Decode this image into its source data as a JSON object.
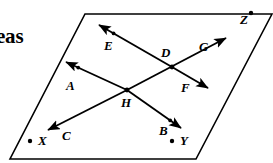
{
  "figure": {
    "margin_text": "eas",
    "plane": {
      "name": "plane-parallelogram",
      "corners": [
        [
          85,
          14
        ],
        [
          272,
          14
        ],
        [
          196,
          159
        ],
        [
          10,
          159
        ]
      ]
    },
    "named_points": [
      {
        "label": "X",
        "dot_side": "left",
        "x": 38,
        "y": 145
      },
      {
        "label": "Y",
        "dot_side": "left",
        "x": 180,
        "y": 145
      },
      {
        "label": "Z",
        "dot_side": "right",
        "x": 240,
        "y": 24
      }
    ],
    "intersection_points": [
      {
        "label": "D",
        "x": 172,
        "y": 67,
        "label_x": 161,
        "label_y": 57
      },
      {
        "label": "H",
        "x": 127,
        "y": 90,
        "label_x": 121,
        "label_y": 107
      }
    ],
    "rays": [
      {
        "id": "ray-A",
        "label": "A",
        "label_x": 66,
        "label_y": 90,
        "from": [
          127,
          90
        ],
        "to": [
          66,
          62
        ],
        "arrow": "to",
        "tick": true
      },
      {
        "id": "ray-B",
        "label": "B",
        "label_x": 159,
        "label_y": 135,
        "from": [
          127,
          90
        ],
        "to": [
          181,
          128
        ],
        "arrow": "to",
        "tick": true
      },
      {
        "id": "ray-C",
        "label": "C",
        "label_x": 62,
        "label_y": 140,
        "from": [
          127,
          90
        ],
        "to": [
          48,
          130
        ],
        "arrow": "to",
        "tick": false
      },
      {
        "id": "ray-G",
        "label": "G",
        "label_x": 199,
        "label_y": 51,
        "from": [
          127,
          90
        ],
        "to": [
          226,
          38
        ],
        "arrow": "to",
        "tick": false
      },
      {
        "id": "ray-E",
        "label": "E",
        "label_x": 104,
        "label_y": 50,
        "from": [
          172,
          67
        ],
        "to": [
          99,
          25
        ],
        "arrow": "to",
        "tick": true
      },
      {
        "id": "ray-F",
        "label": "F",
        "label_x": 181,
        "label_y": 92,
        "from": [
          172,
          67
        ],
        "to": [
          208,
          88
        ],
        "arrow": "to",
        "tick": true
      }
    ],
    "colors": {
      "ink": "#000000",
      "paper": "#ffffff"
    }
  }
}
